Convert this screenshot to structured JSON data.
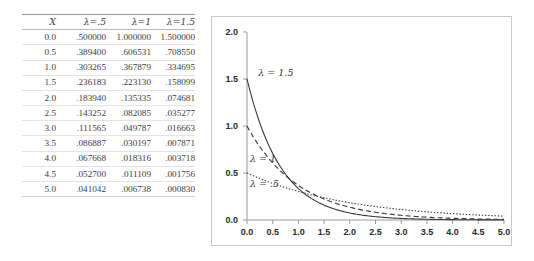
{
  "table": {
    "headers": [
      "X",
      "λ=.5",
      "λ=1",
      "λ=1.5"
    ],
    "rows": [
      [
        "0.0",
        ".500000",
        "1.000000",
        "1.500000"
      ],
      [
        "0.5",
        ".389400",
        ".606531",
        ".708550"
      ],
      [
        "1.0",
        ".303265",
        ".367879",
        ".334695"
      ],
      [
        "1.5",
        ".236183",
        ".223130",
        ".158099"
      ],
      [
        "2.0",
        ".183940",
        ".135335",
        ".074681"
      ],
      [
        "2.5",
        ".143252",
        ".082085",
        ".035277"
      ],
      [
        "3.0",
        ".111565",
        ".049787",
        ".016663"
      ],
      [
        "3.5",
        ".086887",
        ".030197",
        ".007871"
      ],
      [
        "4.0",
        ".067668",
        ".018316",
        ".003718"
      ],
      [
        "4.5",
        ".052700",
        ".011109",
        ".001756"
      ],
      [
        "5.0",
        ".041042",
        ".006738",
        ".000830"
      ]
    ]
  },
  "chart_data": {
    "type": "line",
    "title": "",
    "xlabel": "",
    "ylabel": "",
    "xlim": [
      0.0,
      5.0
    ],
    "ylim": [
      0.0,
      2.0
    ],
    "grid": false,
    "legend_position": "inline-annotations",
    "xticks": [
      "0.0",
      "0.5",
      "1.0",
      "1.5",
      "2.0",
      "2.5",
      "3.0",
      "3.5",
      "4.0",
      "4.5",
      "5.0"
    ],
    "xtick_values": [
      0.0,
      0.5,
      1.0,
      1.5,
      2.0,
      2.5,
      3.0,
      3.5,
      4.0,
      4.5,
      5.0
    ],
    "yticks": [
      "0.0",
      "0.5",
      "1.0",
      "1.5",
      "2.0"
    ],
    "ytick_values": [
      0.0,
      0.5,
      1.0,
      1.5,
      2.0
    ],
    "x": [
      0.0,
      0.5,
      1.0,
      1.5,
      2.0,
      2.5,
      3.0,
      3.5,
      4.0,
      4.5,
      5.0
    ],
    "series": [
      {
        "name": "λ = 1.5",
        "style": "solid",
        "color": "#3a3a3a",
        "annotation": "λ = 1.5",
        "values": [
          1.5,
          0.70855,
          0.334695,
          0.158099,
          0.074681,
          0.035277,
          0.016663,
          0.007871,
          0.003718,
          0.001756,
          0.00083
        ]
      },
      {
        "name": "λ = 1",
        "style": "dashed",
        "color": "#3a3a3a",
        "annotation": "λ = 1",
        "values": [
          1.0,
          0.606531,
          0.367879,
          0.22313,
          0.135335,
          0.082085,
          0.049787,
          0.030197,
          0.018316,
          0.011109,
          0.006738
        ]
      },
      {
        "name": "λ = .5",
        "style": "dotted",
        "color": "#3a3a3a",
        "annotation": "λ = .5",
        "values": [
          0.5,
          0.3894,
          0.303265,
          0.236183,
          0.18394,
          0.143252,
          0.111565,
          0.086887,
          0.067668,
          0.0527,
          0.041042
        ]
      }
    ],
    "annotations": [
      {
        "text": "λ = 1.5",
        "x": 0.22,
        "y": 1.53
      },
      {
        "text": "λ = 1",
        "x": 0.06,
        "y": 0.62
      },
      {
        "text": "λ = .5",
        "x": 0.06,
        "y": 0.355
      }
    ]
  }
}
